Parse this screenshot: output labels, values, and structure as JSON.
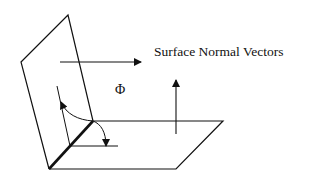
{
  "labels": {
    "surface_normals": "Surface Normal Vectors",
    "angle": "Φ"
  },
  "colors": {
    "line": "#111111",
    "background": "#ffffff"
  },
  "shapes": {
    "vertical_plane": [
      [
        68,
        15
      ],
      [
        21,
        62
      ],
      [
        49,
        169
      ],
      [
        93,
        121
      ]
    ],
    "horizontal_plane": [
      [
        93,
        121
      ],
      [
        223,
        121
      ],
      [
        176,
        169
      ],
      [
        49,
        169
      ]
    ],
    "hinge_edge": [
      [
        49,
        169
      ],
      [
        93,
        121
      ]
    ],
    "normal_arrow_vertical_plane": {
      "from": [
        60,
        62
      ],
      "to": [
        140,
        62
      ]
    },
    "normal_arrow_horizontal_plane": {
      "from": [
        176,
        134
      ],
      "to": [
        176,
        80
      ]
    },
    "inner_vertical_ref": {
      "from": [
        57,
        86
      ],
      "to": [
        70,
        146
      ]
    },
    "inner_horizontal_ref": {
      "from": [
        70,
        146
      ],
      "to": [
        118,
        146
      ]
    }
  }
}
